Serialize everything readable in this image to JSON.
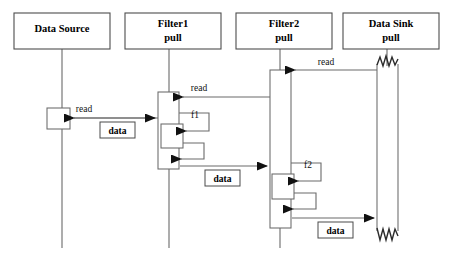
{
  "diagram": {
    "type": "uml-sequence-diagram",
    "canvas": {
      "width": 451,
      "height": 255,
      "background": "#ffffff"
    },
    "colors": {
      "stroke": "#6a6a6a",
      "header_stroke": "#4d4d4d",
      "text": "#000000",
      "jagged_stroke": "#2b2b2b",
      "background": "#ffffff"
    }
  },
  "participants": [
    {
      "id": "data-source",
      "name": "Data Source",
      "stereotype": "",
      "line1": "Data Source",
      "line2": "",
      "box": {
        "x": 14,
        "y": 13,
        "w": 96,
        "h": 36
      },
      "lifeline_x": 62,
      "lifeline_top": 49,
      "lifeline_bottom": 248
    },
    {
      "id": "filter1",
      "name": "Filter1",
      "stereotype": "pull",
      "line1": "Filter1",
      "line2": "pull",
      "box": {
        "x": 125,
        "y": 13,
        "w": 96,
        "h": 36
      },
      "lifeline_x": 169,
      "lifeline_top": 49,
      "lifeline_bottom": 248
    },
    {
      "id": "filter2",
      "name": "Filter2",
      "stereotype": "pull",
      "line1": "Filter2",
      "line2": "pull",
      "box": {
        "x": 236,
        "y": 13,
        "w": 96,
        "h": 36
      },
      "lifeline_x": 280,
      "lifeline_top": 49,
      "lifeline_bottom": 248
    },
    {
      "id": "data-sink",
      "name": "Data Sink",
      "stereotype": "pull",
      "line1": "Data Sink",
      "line2": "pull",
      "box": {
        "x": 343,
        "y": 13,
        "w": 96,
        "h": 36
      },
      "lifeline_x": 387,
      "lifeline_top": 49,
      "lifeline_bottom": 70
    }
  ],
  "activations": [
    {
      "id": "act-data-source",
      "participant": "data-source",
      "x": 47,
      "y": 108,
      "w": 23,
      "h": 21,
      "torn": false
    },
    {
      "id": "act-filter1",
      "participant": "filter1",
      "x": 158,
      "y": 92,
      "w": 21,
      "h": 77,
      "torn": false
    },
    {
      "id": "act-filter1-f1",
      "participant": "filter1",
      "x": 161,
      "y": 124,
      "w": 22,
      "h": 24,
      "torn": false
    },
    {
      "id": "act-filter2",
      "participant": "filter2",
      "x": 270,
      "y": 70,
      "w": 21,
      "h": 158,
      "torn": false
    },
    {
      "id": "act-filter2-f2",
      "participant": "filter2",
      "x": 272,
      "y": 174,
      "w": 22,
      "h": 25,
      "torn": false
    },
    {
      "id": "act-data-sink",
      "participant": "data-sink",
      "x": 377,
      "y": 62,
      "w": 21,
      "h": 170,
      "torn": true
    }
  ],
  "messages": [
    {
      "id": "msg-read-sink-to-filter2",
      "label": "read",
      "kind": "call",
      "from": "data-sink",
      "to": "filter2",
      "direction": "left",
      "y": 70,
      "x_start": 377,
      "x_end": 293,
      "label_x": 326,
      "label_y": 65,
      "boxed": false
    },
    {
      "id": "msg-read-filter2-to-filter1",
      "label": "read",
      "kind": "call",
      "from": "filter2",
      "to": "filter1",
      "direction": "left",
      "y": 97,
      "x_start": 270,
      "x_end": 181,
      "label_x": 199,
      "label_y": 91,
      "boxed": false
    },
    {
      "id": "msg-read-filter1-to-source",
      "label": "read",
      "kind": "call",
      "from": "filter1",
      "to": "data-source",
      "direction": "left",
      "y": 118,
      "x_start": 158,
      "x_end": 72,
      "label_x": 84,
      "label_y": 112,
      "boxed": false
    },
    {
      "id": "msg-data-source-to-filter1",
      "label": "data",
      "kind": "return",
      "from": "data-source",
      "to": "filter1",
      "direction": "right",
      "y": 118,
      "x_start": 74,
      "x_end": 156,
      "label_x": 117,
      "label_y": 131,
      "boxed": true
    },
    {
      "id": "msg-data-filter1-to-filter2",
      "label": "data",
      "kind": "return",
      "from": "filter1",
      "to": "filter2",
      "direction": "right",
      "y": 166,
      "x_start": 180,
      "x_end": 268,
      "label_x": 222,
      "label_y": 179,
      "boxed": true
    },
    {
      "id": "msg-data-filter2-to-sink",
      "label": "data",
      "kind": "return",
      "from": "filter2",
      "to": "data-sink",
      "direction": "right",
      "y": 218,
      "x_start": 292,
      "x_end": 375,
      "label_x": 336,
      "label_y": 231,
      "boxed": true
    }
  ],
  "self_calls": [
    {
      "id": "selfcall-f1",
      "label": "f1",
      "participant": "filter1",
      "label_x": 195,
      "label_y": 118,
      "call": {
        "x_from": 179,
        "y_from": 113,
        "x_out": 209,
        "y_to": 131
      },
      "return": {
        "x_from": 183,
        "y_from": 143,
        "x_out": 204,
        "y_to": 159
      }
    },
    {
      "id": "selfcall-f2",
      "label": "f2",
      "participant": "filter2",
      "label_x": 308,
      "label_y": 168,
      "call": {
        "x_from": 291,
        "y_from": 163,
        "x_out": 321,
        "y_to": 181
      },
      "return": {
        "x_from": 294,
        "y_from": 193,
        "x_out": 316,
        "y_to": 209
      }
    }
  ],
  "labels": {
    "read": "read",
    "data": "data",
    "f1": "f1",
    "f2": "f2",
    "pull": "pull"
  }
}
